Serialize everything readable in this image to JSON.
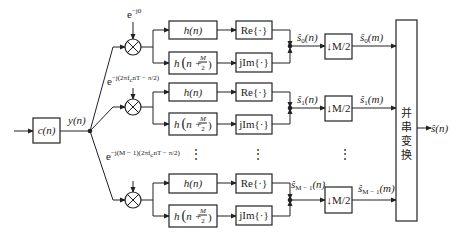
{
  "diagram": {
    "title": "",
    "input_filter": {
      "label": "c(n)"
    },
    "filter_output": {
      "label": "y(n)"
    },
    "branches": [
      {
        "index": 0,
        "exponent": "e^{-j0}",
        "exponent_base": "e",
        "exponent_sup": "−j0",
        "filter_a": "h(n)",
        "filter_b": "h(n + M/2)",
        "real_op": "Re{·}",
        "imag_op": "jIm{·}",
        "sum_label": "ŝ0(n)",
        "decimator": "↓M/2",
        "output_label": "ŝ0(m)"
      },
      {
        "index": 1,
        "exponent": "e^{-j(2πfnT - π/2)}",
        "exponent_base": "e",
        "exponent_sup": "−j(2πfcnT − π/2)",
        "filter_a": "h(n)",
        "filter_b": "h(n + M/2)",
        "real_op": "Re{·}",
        "imag_op": "jIm{·}",
        "sum_label": "ŝ1(n)",
        "decimator": "↓M/2",
        "output_label": "ŝ1(m)"
      },
      {
        "index": "M-1",
        "exponent": "e^{-j(M-1)(2πfnT - π/2)}",
        "exponent_base": "e",
        "exponent_sup": "−j(M − 1)(2πfcnT − π/2)",
        "filter_a": "h(n)",
        "filter_b": "h(n + M/2)",
        "real_op": "Re{·}",
        "imag_op": "jIm{·}",
        "sum_label": "ŝM−1(n)",
        "decimator": "↓M/2",
        "output_label": "ŝM−1(m)"
      }
    ],
    "ellipsis": "⋮",
    "ps_converter": {
      "label_chars": [
        "并",
        "串",
        "变",
        "换"
      ],
      "label": "并串变换"
    },
    "final_output": {
      "label": "ŝ(n)"
    },
    "labels": {
      "c_n": "c(n)",
      "y_n": "y(n)",
      "h_n": "h(n)",
      "h_shift_pre": "h",
      "h_shift_n": "n +",
      "h_shift_M": "M",
      "h_shift_2": "2",
      "re": "Re{·}",
      "jim": "jIm{·}",
      "dec": "↓M/2",
      "s_hat": "ŝ",
      "sub0": "0",
      "sub1": "1",
      "subM": "M − 1",
      "arg_n": "(n)",
      "arg_m": "(m)",
      "e": "e",
      "exp0": "−j0",
      "exp1": "−j(2πf",
      "exp1b": "nT − π/2)",
      "expM": "−j(M − 1)(2πf",
      "expMb": "nT − π/2)",
      "sub_c": "c",
      "out": "ŝ(n)"
    },
    "colors": {
      "line": "#222222",
      "background": "#ffffff"
    }
  }
}
